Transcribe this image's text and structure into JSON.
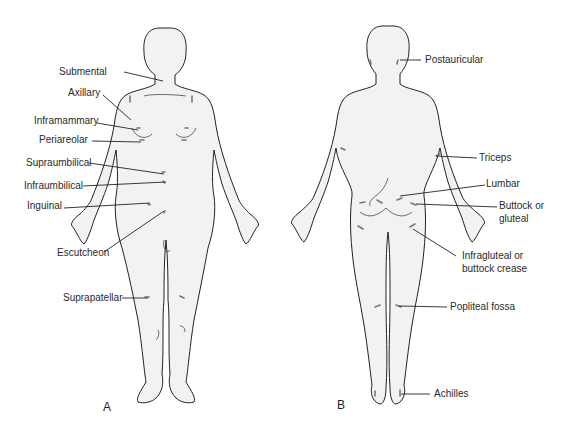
{
  "figure": {
    "panels": [
      {
        "id": "A",
        "label": "A",
        "view": "anterior",
        "sites": [
          {
            "name": "Submental",
            "x": 117,
            "y": 73
          },
          {
            "name": "Axillary",
            "x": 68,
            "y": 94
          },
          {
            "name": "Inframammary",
            "x": 34,
            "y": 121
          },
          {
            "name": "Periareolar",
            "x": 39,
            "y": 140
          },
          {
            "name": "Supraumbilical",
            "x": 26,
            "y": 163
          },
          {
            "name": "Infraumbilical",
            "x": 24,
            "y": 185
          },
          {
            "name": "Inguinal",
            "x": 27,
            "y": 206
          },
          {
            "name": "Escutcheon",
            "x": 57,
            "y": 253
          },
          {
            "name": "Suprapatellar",
            "x": 63,
            "y": 298
          }
        ]
      },
      {
        "id": "B",
        "label": "B",
        "view": "posterior",
        "sites": [
          {
            "name": "Postauricular",
            "x": 425,
            "y": 60
          },
          {
            "name": "Triceps",
            "x": 479,
            "y": 158
          },
          {
            "name": "Lumbar",
            "x": 486,
            "y": 184
          },
          {
            "name": "Buttock or",
            "x": 499,
            "y": 206
          },
          {
            "name": "gluteal",
            "x": 499,
            "y": 219
          },
          {
            "name": "Infragluteal or",
            "x": 462,
            "y": 256
          },
          {
            "name": "buttock crease",
            "x": 462,
            "y": 269
          },
          {
            "name": "Popliteal fossa",
            "x": 450,
            "y": 307
          },
          {
            "name": "Achilles",
            "x": 434,
            "y": 394
          }
        ]
      }
    ]
  }
}
